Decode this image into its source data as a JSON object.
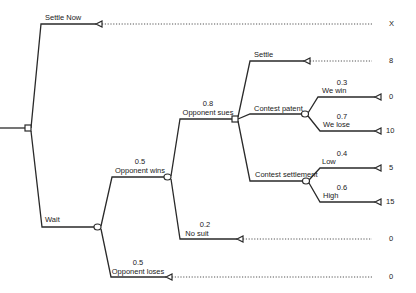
{
  "diagram": {
    "type": "decision-tree",
    "root": {
      "kind": "decision"
    },
    "branches": {
      "settle_now": {
        "label": "Settle Now",
        "payoff": "X"
      },
      "wait": {
        "label": "Wait"
      },
      "opponent_wins": {
        "label": "Opponent wins",
        "prob": "0.5"
      },
      "opponent_loses": {
        "label": "Opponent loses",
        "prob": "0.5",
        "payoff": "0"
      },
      "opponent_sues": {
        "label": "Opponent sues",
        "prob": "0.8"
      },
      "no_suit": {
        "label": "No suit",
        "prob": "0.2",
        "payoff": "0"
      },
      "settle": {
        "label": "Settle",
        "payoff": "8"
      },
      "contest_patent": {
        "label": "Contest patent"
      },
      "contest_settlement": {
        "label": "Contest settlement"
      },
      "we_win": {
        "label": "We win",
        "prob": "0.3",
        "payoff": "0"
      },
      "we_lose": {
        "label": "We lose",
        "prob": "0.7",
        "payoff": "10"
      },
      "low": {
        "label": "Low",
        "prob": "0.4",
        "payoff": "5"
      },
      "high": {
        "label": "High",
        "prob": "0.6",
        "payoff": "15"
      }
    }
  }
}
